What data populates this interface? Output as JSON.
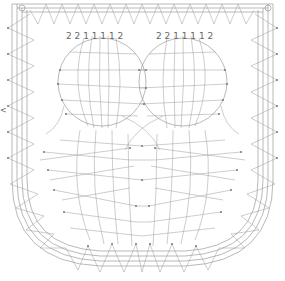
{
  "diagram": {
    "type": "bobbin-lace-pricking",
    "colors": {
      "line": "#8a8a8a",
      "pin": "#777777",
      "background": "#ffffff"
    },
    "left_marker": "<",
    "left_circle_labels": [
      "2",
      "2",
      "1",
      "1",
      "1",
      "1",
      "2"
    ],
    "right_circle_labels": [
      "2",
      "2",
      "1",
      "1",
      "1",
      "1",
      "2"
    ],
    "left_label_text": "2 2 1 1 1 1 2",
    "right_label_text": "2 2 1 1 1 1 2"
  }
}
